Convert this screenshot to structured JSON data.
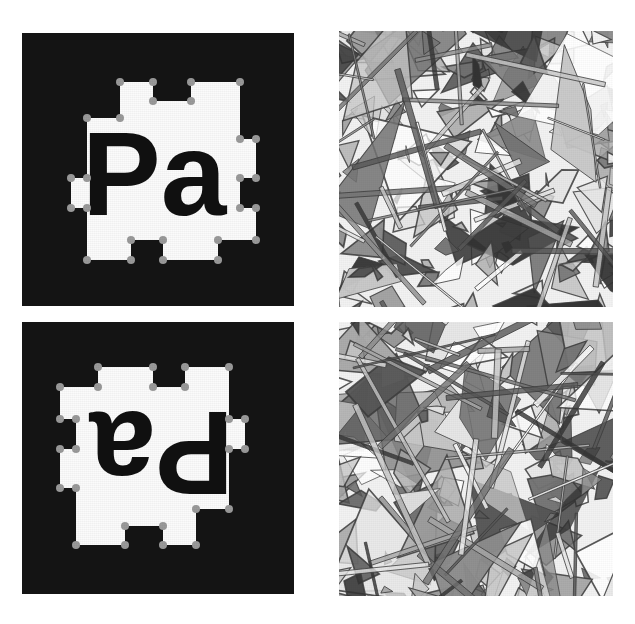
{
  "figure": {
    "title": "Four-panel grayscale figure",
    "layout": "2x2 grid",
    "background_color": "#ffffff",
    "panels": [
      {
        "id": "top-left",
        "kind": "binary-mask-with-polygon",
        "caption": "",
        "background_color": "#141414",
        "foreground_color": "#ffffff",
        "text_color": "#101010",
        "vertex_color": "#9a9a9a",
        "label_text": "Pa",
        "rotation_degrees": 0
      },
      {
        "id": "top-right",
        "kind": "random-polygon-texture",
        "caption": "",
        "background_color": "#f2f2f2",
        "outline_color": "#3c3c3c"
      },
      {
        "id": "bottom-left",
        "kind": "binary-mask-with-polygon",
        "caption": "",
        "background_color": "#141414",
        "foreground_color": "#ffffff",
        "text_color": "#101010",
        "vertex_color": "#9a9a9a",
        "label_text": "Pa",
        "rotation_degrees": 180
      },
      {
        "id": "bottom-right",
        "kind": "random-polygon-texture",
        "caption": "",
        "background_color": "#f2f2f2",
        "outline_color": "#3c3c3c"
      }
    ]
  },
  "chart_data": {
    "type": "scatter",
    "title": "",
    "xlabel": "",
    "ylabel": "",
    "mask_polygon": {
      "description": "Rectilinear white region outline traced over the letters 'Pa'",
      "vertex_count": 26,
      "vertices_normalized": [
        [
          0.36,
          0.18
        ],
        [
          0.48,
          0.18
        ],
        [
          0.48,
          0.25
        ],
        [
          0.62,
          0.25
        ],
        [
          0.62,
          0.18
        ],
        [
          0.8,
          0.18
        ],
        [
          0.8,
          0.39
        ],
        [
          0.86,
          0.39
        ],
        [
          0.86,
          0.53
        ],
        [
          0.8,
          0.53
        ],
        [
          0.8,
          0.64
        ],
        [
          0.86,
          0.64
        ],
        [
          0.86,
          0.76
        ],
        [
          0.72,
          0.76
        ],
        [
          0.72,
          0.83
        ],
        [
          0.52,
          0.83
        ],
        [
          0.52,
          0.76
        ],
        [
          0.4,
          0.76
        ],
        [
          0.4,
          0.83
        ],
        [
          0.24,
          0.83
        ],
        [
          0.24,
          0.64
        ],
        [
          0.18,
          0.64
        ],
        [
          0.18,
          0.53
        ],
        [
          0.24,
          0.53
        ],
        [
          0.24,
          0.31
        ],
        [
          0.36,
          0.31
        ]
      ]
    },
    "texture_polygons": {
      "description": "Randomly generated convex shards filling the panel",
      "count_top_right": 180,
      "count_bottom_right": 180,
      "fill_gray_levels": [
        0.2,
        0.34,
        0.45,
        0.55,
        0.66,
        0.78,
        0.9,
        1.0
      ]
    }
  }
}
